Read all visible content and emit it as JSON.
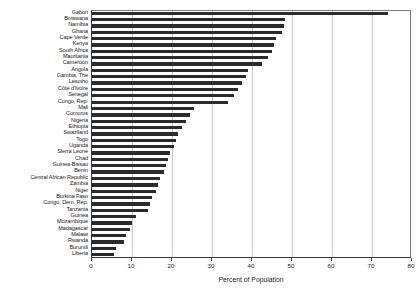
{
  "chart_data": {
    "type": "bar",
    "orientation": "horizontal",
    "title": "",
    "subtitle": "",
    "xlabel": "Percent of Population",
    "ylabel": "",
    "xlim": [
      0,
      80
    ],
    "xticks": [
      0,
      10,
      20,
      30,
      40,
      50,
      60,
      70,
      80
    ],
    "xticklabels": [
      "0",
      "10",
      "20",
      "30",
      "40",
      "50",
      "60",
      "70",
      "80"
    ],
    "grid": "vertical",
    "legend": null,
    "bar_color": "#2b2b2f",
    "categories": [
      "Gabon",
      "Botswana",
      "Namibia",
      "Ghana",
      "Cape Verde",
      "Kenya",
      "South Africa",
      "Mauritania",
      "Cameroon",
      "Angola",
      "Gambia, The",
      "Lesotho",
      "Côte d'Ivoire",
      "Senegal",
      "Congo, Rep.",
      "Mali",
      "Comoros",
      "Nigeria",
      "Ethiopia",
      "Swaziland",
      "Togo",
      "Uganda",
      "Sierra Leone",
      "Chad",
      "Guinea-Bissau",
      "Benin",
      "Central African Republic",
      "Zambia",
      "Niger",
      "Burkina Faso",
      "Congo, Dem. Rep.",
      "Tanzania",
      "Guinea",
      "Mozambique",
      "Madagascar",
      "Malawi",
      "Rwanda",
      "Burundi",
      "Liberia"
    ],
    "values": [
      74.0,
      48.2,
      48.0,
      47.5,
      46.0,
      45.5,
      45.0,
      44.0,
      42.5,
      39.0,
      38.5,
      37.5,
      36.5,
      35.5,
      34.0,
      25.5,
      24.5,
      23.5,
      22.5,
      21.5,
      21.0,
      20.5,
      19.5,
      19.0,
      18.5,
      18.0,
      17.0,
      16.5,
      16.0,
      15.0,
      14.5,
      14.0,
      11.0,
      10.0,
      9.5,
      8.5,
      8.0,
      6.0,
      5.5
    ]
  }
}
